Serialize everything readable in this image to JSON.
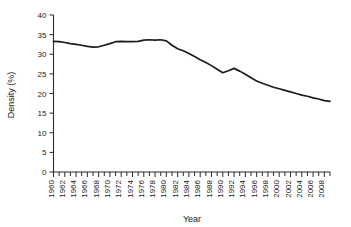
{
  "chart_data": {
    "type": "line",
    "title": "",
    "xlabel": "Year",
    "ylabel": "Density (%)",
    "xlim": [
      1960,
      2009
    ],
    "ylim": [
      0,
      40
    ],
    "yticks": [
      0,
      5,
      10,
      15,
      20,
      25,
      30,
      35,
      40
    ],
    "ytick_labels": [
      "0",
      "5",
      "10",
      "15",
      "20",
      "25",
      "30",
      "35",
      "40"
    ],
    "xtick_labels": [
      "1960",
      "1962",
      "1964",
      "1966",
      "1968",
      "1970",
      "1972",
      "1974",
      "1976",
      "1978",
      "1980",
      "1982",
      "1984",
      "1986",
      "1988",
      "1990",
      "1992",
      "1994",
      "1996",
      "1998",
      "2000",
      "2002",
      "2004",
      "2006",
      "2008"
    ],
    "xtick_label_interval": 2,
    "minor_tick_interval": 1,
    "grid": false,
    "legend": false,
    "legend_position": "none",
    "line_color": "#1c1c1c",
    "x": [
      1960,
      1961,
      1962,
      1963,
      1964,
      1965,
      1966,
      1967,
      1968,
      1969,
      1970,
      1971,
      1972,
      1973,
      1974,
      1975,
      1976,
      1977,
      1978,
      1979,
      1980,
      1981,
      1982,
      1983,
      1984,
      1985,
      1986,
      1987,
      1988,
      1989,
      1990,
      1991,
      1992,
      1993,
      1994,
      1995,
      1996,
      1997,
      1998,
      1999,
      2000,
      2001,
      2002,
      2003,
      2004,
      2005,
      2006,
      2007,
      2008,
      2009
    ],
    "values": [
      33.3,
      33.2,
      33.0,
      32.7,
      32.5,
      32.3,
      32.0,
      31.8,
      31.9,
      32.3,
      32.7,
      33.2,
      33.3,
      33.2,
      33.2,
      33.3,
      33.6,
      33.7,
      33.6,
      33.7,
      33.4,
      32.3,
      31.4,
      30.9,
      30.2,
      29.4,
      28.6,
      27.9,
      27.1,
      26.2,
      25.3,
      25.8,
      26.4,
      25.7,
      24.9,
      24.0,
      23.2,
      22.6,
      22.1,
      21.6,
      21.2,
      20.8,
      20.4,
      20.0,
      19.6,
      19.3,
      18.9,
      18.6,
      18.2,
      18.0
    ],
    "series": [
      {
        "name": "Density (%)",
        "values": [
          33.3,
          33.2,
          33.0,
          32.7,
          32.5,
          32.3,
          32.0,
          31.8,
          31.9,
          32.3,
          32.7,
          33.2,
          33.3,
          33.2,
          33.2,
          33.3,
          33.6,
          33.7,
          33.6,
          33.7,
          33.4,
          32.3,
          31.4,
          30.9,
          30.2,
          29.4,
          28.6,
          27.9,
          27.1,
          26.2,
          25.3,
          25.8,
          26.4,
          25.7,
          24.9,
          24.0,
          23.2,
          22.6,
          22.1,
          21.6,
          21.2,
          20.8,
          20.4,
          20.0,
          19.6,
          19.3,
          18.9,
          18.6,
          18.2,
          18.0
        ]
      }
    ]
  }
}
